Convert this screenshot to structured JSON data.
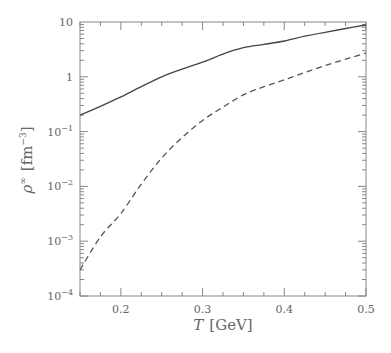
{
  "chart_data": {
    "type": "line",
    "title": "",
    "xlabel": "T [GeV]",
    "ylabel": "ρ^∞ [fm^-3]",
    "xlim": [
      0.15,
      0.5
    ],
    "ylim": [
      0.0001,
      10
    ],
    "yscale": "log",
    "grid": false,
    "legend": null,
    "x_ticks": [
      {
        "value": 0.2,
        "label": "0.2"
      },
      {
        "value": 0.3,
        "label": "0.3"
      },
      {
        "value": 0.4,
        "label": "0.4"
      },
      {
        "value": 0.5,
        "label": "0.5"
      }
    ],
    "y_ticks": [
      {
        "value": 10,
        "base": "10",
        "exp": ""
      },
      {
        "value": 1,
        "base": "1",
        "exp": ""
      },
      {
        "value": 0.1,
        "base": "10",
        "exp": "−1"
      },
      {
        "value": 0.01,
        "base": "10",
        "exp": "−2"
      },
      {
        "value": 0.001,
        "base": "10",
        "exp": "−3"
      },
      {
        "value": 0.0001,
        "base": "10",
        "exp": "−4"
      }
    ],
    "x": [
      0.15,
      0.175,
      0.2,
      0.225,
      0.25,
      0.275,
      0.3,
      0.325,
      0.35,
      0.375,
      0.4,
      0.425,
      0.45,
      0.475,
      0.5
    ],
    "series": [
      {
        "name": "solid",
        "style": "solid",
        "color": "#444444",
        "values": [
          0.2,
          0.29,
          0.43,
          0.66,
          1.0,
          1.38,
          1.85,
          2.6,
          3.4,
          3.9,
          4.5,
          5.5,
          6.5,
          7.6,
          8.8
        ]
      },
      {
        "name": "dashed",
        "style": "dashed",
        "color": "#555555",
        "values": [
          0.0003,
          0.0012,
          0.0032,
          0.011,
          0.033,
          0.078,
          0.16,
          0.28,
          0.47,
          0.66,
          0.88,
          1.2,
          1.6,
          2.1,
          2.7
        ]
      }
    ]
  },
  "labels": {
    "x_axis": {
      "var": "T",
      "unit": "[GeV]"
    },
    "y_axis": {
      "var": "ρ",
      "sup": "∞",
      "unit_open": "[fm",
      "unit_sup": "−3",
      "unit_close": "]"
    }
  }
}
